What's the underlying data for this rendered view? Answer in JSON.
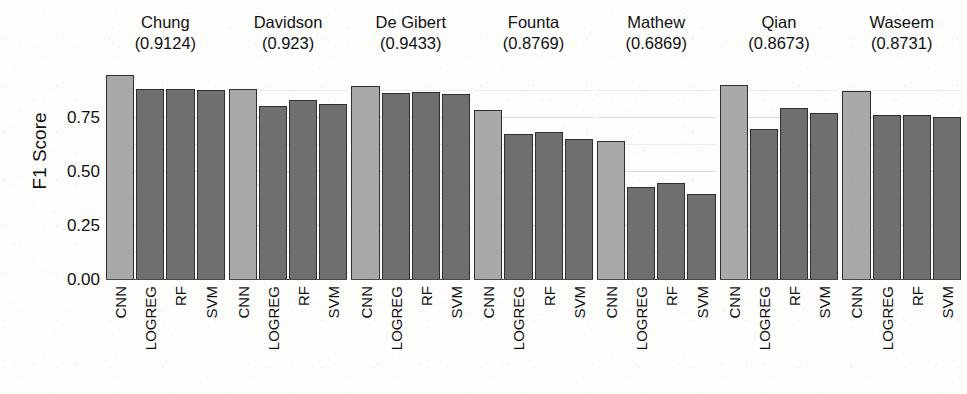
{
  "chart_data": {
    "type": "bar",
    "title": "",
    "xlabel": "",
    "ylabel": "F1 Score",
    "ylim": [
      0,
      1.0
    ],
    "yticks": [
      0.0,
      0.25,
      0.5,
      0.75
    ],
    "ytick_labels": [
      "0.00",
      "0.25",
      "0.50",
      "0.75"
    ],
    "grid": true,
    "legend": "none",
    "facet_layout": "1 row x 7 columns",
    "categories": [
      "CNN",
      "LOGREG",
      "RF",
      "SVM"
    ],
    "colors": {
      "cnn_bar": "#a9a9a9",
      "other_bar": "#6f6f6f",
      "bar_outline": "#2f2f2f",
      "text": "#111111",
      "background": "#fdfdfc",
      "gridline": "#969696"
    },
    "panels": [
      {
        "name": "Chung",
        "score": "(0.9124)",
        "values": [
          0.95,
          0.885,
          0.885,
          0.88
        ]
      },
      {
        "name": "Davidson",
        "score": "(0.923)",
        "values": [
          0.885,
          0.805,
          0.835,
          0.815
        ]
      },
      {
        "name": "De Gibert",
        "score": "(0.9433)",
        "values": [
          0.9,
          0.865,
          0.87,
          0.86
        ]
      },
      {
        "name": "Founta",
        "score": "(0.8769)",
        "values": [
          0.785,
          0.675,
          0.685,
          0.655
        ]
      },
      {
        "name": "Mathew",
        "score": "(0.6869)",
        "values": [
          0.645,
          0.43,
          0.45,
          0.4
        ]
      },
      {
        "name": "Qian",
        "score": "(0.8673)",
        "values": [
          0.905,
          0.7,
          0.795,
          0.775
        ]
      },
      {
        "name": "Waseem",
        "score": "(0.8731)",
        "values": [
          0.875,
          0.765,
          0.765,
          0.755
        ]
      }
    ]
  }
}
